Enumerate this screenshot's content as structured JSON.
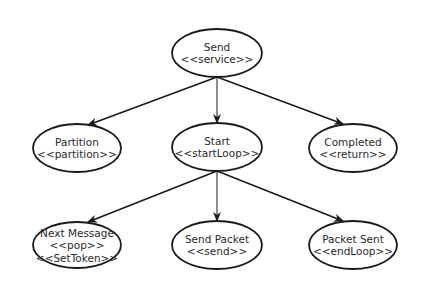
{
  "diagram": {
    "nodes": [
      {
        "id": "send",
        "cx": 217,
        "cy": 53,
        "rx": 45,
        "ry": 24,
        "lines": [
          "Send",
          "<<service>>"
        ]
      },
      {
        "id": "partition",
        "cx": 77,
        "cy": 148,
        "rx": 44,
        "ry": 24,
        "lines": [
          "Partition",
          "<<partition>>"
        ]
      },
      {
        "id": "start",
        "cx": 217,
        "cy": 147,
        "rx": 45,
        "ry": 24,
        "lines": [
          "Start",
          "<<startLoop>>"
        ]
      },
      {
        "id": "completed",
        "cx": 353,
        "cy": 148,
        "rx": 44,
        "ry": 24,
        "lines": [
          "Completed",
          "<<return>>"
        ]
      },
      {
        "id": "next-message",
        "cx": 77,
        "cy": 245,
        "rx": 44,
        "ry": 23,
        "lines": [
          "Next Message",
          "<<pop>>",
          "<<SetToken>>"
        ]
      },
      {
        "id": "send-packet",
        "cx": 217,
        "cy": 245,
        "rx": 45,
        "ry": 24,
        "lines": [
          "Send Packet",
          "<<send>>"
        ]
      },
      {
        "id": "packet-sent",
        "cx": 353,
        "cy": 245,
        "rx": 44,
        "ry": 24,
        "lines": [
          "Packet Sent",
          "<<endLoop>>"
        ]
      }
    ],
    "edges": [
      {
        "from": "send",
        "to": "partition",
        "x1": 217,
        "y1": 77,
        "x2": 88,
        "y2": 125
      },
      {
        "from": "send",
        "to": "start",
        "x1": 217,
        "y1": 77,
        "x2": 217,
        "y2": 123
      },
      {
        "from": "send",
        "to": "completed",
        "x1": 217,
        "y1": 77,
        "x2": 343,
        "y2": 124
      },
      {
        "from": "start",
        "to": "next-message",
        "x1": 217,
        "y1": 171,
        "x2": 88,
        "y2": 222
      },
      {
        "from": "start",
        "to": "send-packet",
        "x1": 217,
        "y1": 171,
        "x2": 217,
        "y2": 221
      },
      {
        "from": "start",
        "to": "packet-sent",
        "x1": 217,
        "y1": 171,
        "x2": 343,
        "y2": 221
      }
    ],
    "colors": {
      "stroke": "#1a1a1a",
      "text": "#2a2a2a",
      "background": "#ffffff"
    }
  }
}
